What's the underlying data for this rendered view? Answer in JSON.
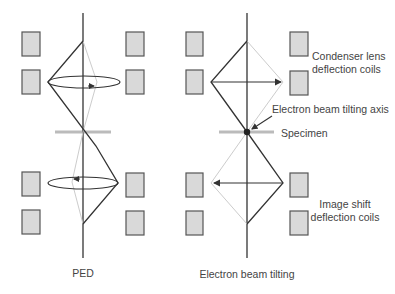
{
  "diagram": {
    "type": "beam-path-schematic",
    "panels": [
      {
        "id": "ped",
        "caption": "PED",
        "axis_x": 83,
        "description": "Precession: beam rotated by deflection coils tracing a cone (ellipse rotation arrows)"
      },
      {
        "id": "tilting",
        "caption": "Electron beam tilting",
        "axis_x": 247,
        "description": "Beam tilted about specimen point with straight deflection arrows"
      }
    ],
    "labels": {
      "condenser_line1": "Condenser lens",
      "condenser_line2": "deflection coils",
      "tilting_axis": "Electron beam tilting axis",
      "specimen": "Specimen",
      "image_shift_line1": "Image shift",
      "image_shift_line2": "deflection coils"
    },
    "colors": {
      "coil_fill": "#d9d9d9",
      "coil_stroke": "#555555",
      "beam": "#333333",
      "beam_faint": "#cccccc",
      "specimen": "#bbbbbb",
      "text": "#444444"
    }
  }
}
